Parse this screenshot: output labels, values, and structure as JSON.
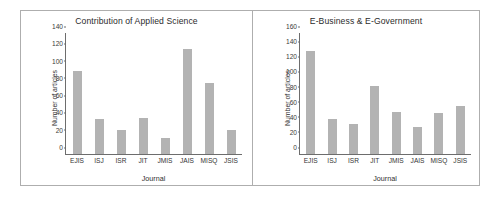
{
  "figure": {
    "background": "#ffffff",
    "bar_color": "#b3b3b3",
    "axis_color": "#6d6d6d",
    "panel_border_color": "#aeaeae"
  },
  "chart_data": [
    {
      "type": "bar",
      "title": "Contribution of Applied Science",
      "xlabel": "Journal",
      "ylabel": "Number of articles",
      "categories": [
        "EJIS",
        "ISJ",
        "ISR",
        "JIT",
        "JMIS",
        "JAIS",
        "MISQ",
        "JSIS"
      ],
      "values": [
        96,
        41,
        28,
        42,
        19,
        122,
        82,
        28
      ],
      "ylim": [
        0,
        140
      ],
      "yticks": [
        0,
        20,
        40,
        60,
        80,
        100,
        120,
        140
      ],
      "grid": false,
      "legend": "none"
    },
    {
      "type": "bar",
      "title": "E-Business & E-Government",
      "xlabel": "Journal",
      "ylabel": "Number of articles",
      "categories": [
        "EJIS",
        "ISJ",
        "ISR",
        "JIT",
        "JMIS",
        "JAIS",
        "MISQ",
        "JSIS"
      ],
      "values": [
        136,
        46,
        40,
        90,
        56,
        36,
        54,
        63
      ],
      "ylim": [
        0,
        160
      ],
      "yticks": [
        0,
        20,
        40,
        60,
        80,
        100,
        120,
        140,
        160
      ],
      "grid": false,
      "legend": "none"
    }
  ]
}
